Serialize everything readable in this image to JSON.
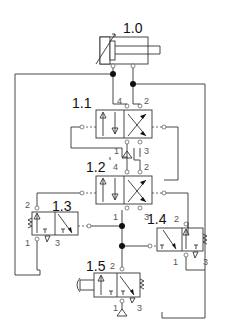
{
  "diagram": {
    "type": "pneumatic circuit",
    "components": [
      {
        "id": "1.0",
        "label": "1.0",
        "kind": "double-acting cylinder with adjustable cushioning"
      },
      {
        "id": "1.1",
        "label": "1.1",
        "kind": "4/2 pilot-operated directional valve",
        "ports": [
          "4",
          "2",
          "1",
          "3"
        ]
      },
      {
        "id": "1.2",
        "label": "1.2",
        "kind": "4/2 pilot-operated directional valve",
        "ports": [
          "4",
          "2",
          "1",
          "3"
        ]
      },
      {
        "id": "1.3",
        "label": "1.3",
        "kind": "3/2 pilot-operated valve, spring return",
        "ports": [
          "2",
          "1",
          "3"
        ]
      },
      {
        "id": "1.4",
        "label": "1.4",
        "kind": "3/2 pilot-operated valve, spring return",
        "ports": [
          "2",
          "1",
          "3"
        ]
      },
      {
        "id": "1.5",
        "label": "1.5",
        "kind": "3/2 push-button valve, spring return",
        "ports": [
          "2",
          "1",
          "3"
        ]
      }
    ],
    "port_labels": {
      "p4": "4",
      "p2": "2",
      "p1": "1",
      "p3": "3"
    }
  }
}
